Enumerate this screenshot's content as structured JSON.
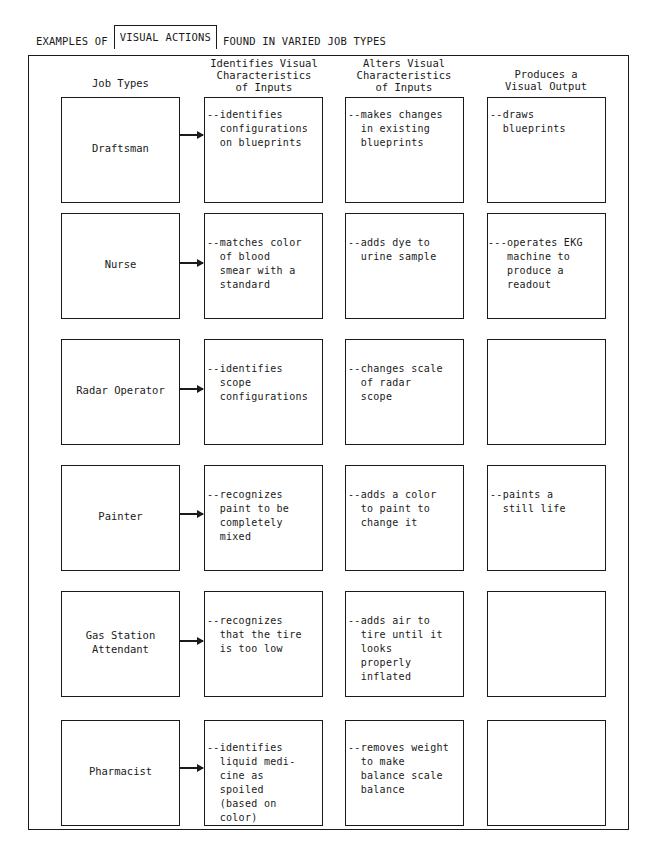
{
  "title": {
    "prefix": "EXAMPLES OF",
    "boxed": "VISUAL ACTIONS",
    "suffix": "FOUND IN VARIED JOB TYPES"
  },
  "columns": [
    {
      "label": "Job Types"
    },
    {
      "label": "Identifies Visual\nCharacteristics\nof Inputs"
    },
    {
      "label": "Alters Visual\nCharacteristics\nof Inputs"
    },
    {
      "label": "Produces a\nVisual Output"
    }
  ],
  "rows": [
    {
      "job": "Draftsman",
      "identifies": "--identifies\n  configurations\n  on blueprints",
      "alters": "--makes changes\n  in existing\n  blueprints",
      "produces": "--draws\n  blueprints"
    },
    {
      "job": "Nurse",
      "identifies": "--matches color\n  of blood\n  smear with a\n  standard",
      "alters": "--adds dye to\n  urine sample",
      "produces": "---operates EKG\n   machine to\n   produce a\n   readout"
    },
    {
      "job": "Radar Operator",
      "identifies": "--identifies\n  scope\n  configurations",
      "alters": "--changes scale\n  of radar\n  scope",
      "produces": ""
    },
    {
      "job": "Painter",
      "identifies": "--recognizes\n  paint to be\n  completely\n  mixed",
      "alters": "--adds a color\n  to paint to\n  change it",
      "produces": "--paints a\n  still life"
    },
    {
      "job": "Gas Station\nAttendant",
      "identifies": "--recognizes\n  that the tire\n  is too low",
      "alters": "--adds air to\n  tire until it\n  looks\n  properly\n  inflated",
      "produces": ""
    },
    {
      "job": "Pharmacist",
      "identifies": "--identifies\n  liquid medi-\n  cine as\n  spoiled\n  (based on\n  color)",
      "alters": "--removes weight\n  to make\n  balance scale\n  balance",
      "produces": ""
    }
  ]
}
